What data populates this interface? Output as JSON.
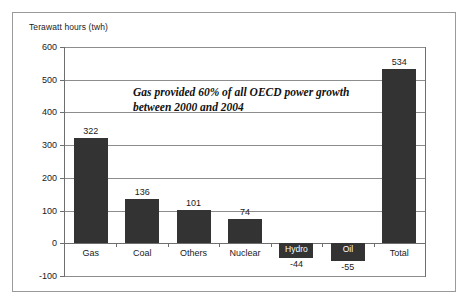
{
  "chart_data": {
    "type": "bar",
    "title": "",
    "subtitle": "",
    "ylabel": "Terawatt hours (twh)",
    "xlabel": "",
    "categories": [
      "Gas",
      "Coal",
      "Others",
      "Nuclear",
      "Hydro",
      "Oil",
      "Total"
    ],
    "values": [
      322,
      136,
      101,
      74,
      -44,
      -55,
      534
    ],
    "value_labels": [
      "322",
      "136",
      "101",
      "74",
      "-44",
      "-55",
      "534"
    ],
    "ylim": [
      -100,
      600
    ],
    "yticks": [
      600,
      500,
      400,
      300,
      200,
      100,
      0,
      -100
    ],
    "ytick_labels": [
      "600",
      "500",
      "400",
      "300",
      "200",
      "100",
      "0",
      "-100"
    ],
    "grid": true,
    "legend": "none",
    "bar_color": "#333333",
    "gridline_color": "#8d8d8d",
    "axis_color": "#6e6e6e",
    "annotations": [
      {
        "line1": "Gas provided 60% of all OECD power growth",
        "line2": "between 2000 and 2004"
      }
    ]
  },
  "axis": {
    "y_title": "Terawatt hours (twh)"
  }
}
